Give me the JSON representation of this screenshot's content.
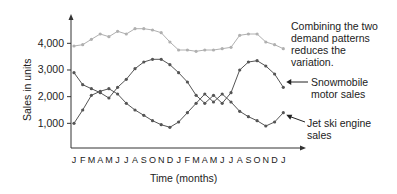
{
  "chart_data": {
    "type": "line",
    "title": "",
    "xlabel": "Time (months)",
    "ylabel": "Sales in units",
    "categories": [
      "J",
      "F",
      "M",
      "A",
      "M",
      "J",
      "J",
      "A",
      "S",
      "O",
      "N",
      "D",
      "J",
      "F",
      "M",
      "A",
      "M",
      "J",
      "J",
      "A",
      "S",
      "O",
      "N",
      "D",
      "J"
    ],
    "yticks": [
      "1,000",
      "2,000",
      "3,000",
      "4,000"
    ],
    "ytick_values": [
      1000,
      2000,
      3000,
      4000
    ],
    "ylim": [
      0,
      4700
    ],
    "grid": false,
    "series": [
      {
        "name": "Combined total",
        "color": "#b0b0b0",
        "values": [
          3900,
          3950,
          4150,
          4350,
          4250,
          4450,
          4350,
          4550,
          4550,
          4500,
          4400,
          4050,
          3750,
          3750,
          3700,
          3750,
          3750,
          3800,
          3850,
          4300,
          4350,
          4350,
          4050,
          3950,
          3800
        ]
      },
      {
        "name": "Snowmobile motor sales",
        "color": "#555555",
        "values": [
          2900,
          2450,
          2300,
          2150,
          1950,
          2350,
          2650,
          3050,
          3300,
          3400,
          3400,
          3200,
          2900,
          2550,
          2050,
          1750,
          2050,
          1750,
          2150,
          3000,
          3300,
          3350,
          3150,
          2850,
          2350
        ]
      },
      {
        "name": "Jet ski engine sales",
        "color": "#555555",
        "values": [
          1000,
          1500,
          2050,
          2200,
          2300,
          2100,
          1750,
          1500,
          1300,
          1100,
          950,
          850,
          1050,
          1400,
          1750,
          2100,
          1800,
          2100,
          1800,
          1450,
          1250,
          1100,
          900,
          1050,
          1400
        ]
      }
    ],
    "annotations": [
      {
        "text_lines": [
          "Combining the two",
          "demand patterns",
          "reduces the",
          "variation."
        ],
        "target": "Combined total"
      },
      {
        "text_lines": [
          "Snowmobile",
          "motor sales"
        ],
        "target": "Snowmobile motor sales",
        "arrow": true
      },
      {
        "text_lines": [
          "Jet ski engine",
          "sales"
        ],
        "target": "Jet ski engine sales",
        "arrow": true
      }
    ]
  },
  "labels": {
    "ylabel": "Sales in units",
    "xlabel": "Time (months)",
    "annot_combined": [
      "Combining the two",
      "demand patterns",
      "reduces the",
      "variation."
    ],
    "annot_snow": [
      "Snowmobile",
      "motor sales"
    ],
    "annot_jet": [
      "Jet ski engine",
      "sales"
    ]
  }
}
